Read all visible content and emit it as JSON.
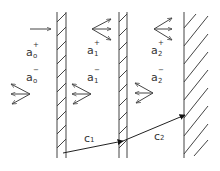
{
  "diagram": {
    "stroke": "#444444",
    "walls": [
      {
        "id": "wall-1",
        "x1": 57,
        "x2": 66,
        "y1": 12,
        "y2": 158
      },
      {
        "id": "wall-2",
        "x1": 119,
        "x2": 127,
        "y1": 12,
        "y2": 158
      },
      {
        "id": "wall-3",
        "x1": 184,
        "y1": 12,
        "y2": 158
      }
    ],
    "labels": {
      "a0_plus": {
        "base": "a",
        "sup": "+",
        "sub": "o"
      },
      "a0_minus": {
        "base": "a",
        "sup": "−",
        "sub": "o"
      },
      "a1_plus": {
        "base": "a",
        "sup": "+",
        "sub": "1"
      },
      "a1_minus": {
        "base": "a",
        "sup": "−",
        "sub": "1"
      },
      "a2_plus": {
        "base": "a",
        "sup": "+",
        "sub": "2"
      },
      "a2_minus": {
        "base": "a",
        "sup": "−",
        "sub": "2"
      },
      "c1": {
        "base": "c",
        "sub": "1"
      },
      "c2": {
        "base": "c",
        "sub": "2"
      }
    }
  }
}
